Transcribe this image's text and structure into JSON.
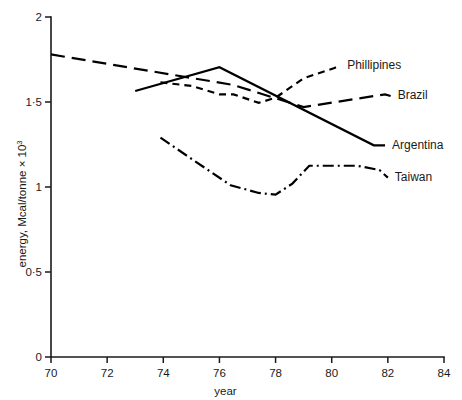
{
  "chart_data": {
    "type": "line",
    "title": "",
    "xlabel": "year",
    "ylabel": "energy, Mcal/tonne × 10",
    "ylabel_exponent": "3",
    "xlim": [
      70,
      84
    ],
    "ylim": [
      0,
      2
    ],
    "xticks": [
      70,
      72,
      74,
      76,
      78,
      80,
      82,
      84
    ],
    "xticklabels": [
      "70",
      "72",
      "74",
      "76",
      "78",
      "80",
      "82",
      "84"
    ],
    "yticks": [
      0,
      0.5,
      1,
      1.5,
      2
    ],
    "yticklabels": [
      "0",
      "0·5",
      "1",
      "1·5",
      "2"
    ],
    "grid": false,
    "legend_position": "right-inline-labels",
    "series": [
      {
        "name": "Phillipines",
        "label": "Phillipines",
        "dash": "short-dash",
        "dasharray": "7,5",
        "label_x": 80.3,
        "label_y": 1.715,
        "x": [
          73.9,
          75.0,
          76.0,
          76.5,
          77.4,
          78.0,
          79.0,
          80.1
        ],
        "y": [
          1.615,
          1.595,
          1.545,
          1.545,
          1.495,
          1.525,
          1.64,
          1.7
        ]
      },
      {
        "name": "Brazil",
        "label": "Brazil",
        "dash": "long-dash",
        "dasharray": "14,7",
        "label_x": 82.1,
        "label_y": 1.535,
        "x": [
          70.0,
          76.5,
          79.0,
          81.9
        ],
        "y": [
          1.78,
          1.6,
          1.47,
          1.545
        ]
      },
      {
        "name": "Argentina",
        "label": "Argentina",
        "dash": "solid",
        "dasharray": "",
        "label_x": 81.9,
        "label_y": 1.245,
        "x": [
          73.0,
          76.0,
          81.5
        ],
        "y": [
          1.565,
          1.705,
          1.245
        ]
      },
      {
        "name": "Taiwan",
        "label": "Taiwan",
        "dash": "dash-dot",
        "dasharray": "11,4,2,4",
        "label_x": 82.0,
        "label_y": 1.055,
        "x": [
          73.9,
          75.1,
          76.4,
          77.4,
          78.0,
          78.6,
          79.2,
          80.9,
          81.7
        ],
        "y": [
          1.29,
          1.155,
          1.01,
          0.965,
          0.955,
          1.02,
          1.125,
          1.125,
          1.1
        ]
      }
    ]
  },
  "axes": {
    "y_label_prefix": "energy, Mcal/tonne × 10",
    "y_label_sup": "3",
    "x_label": "year"
  }
}
